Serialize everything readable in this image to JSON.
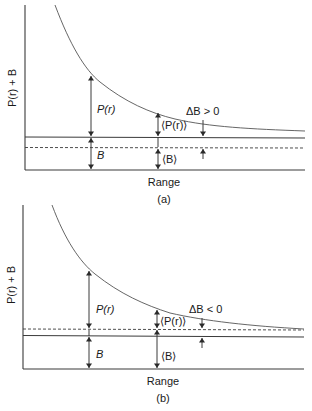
{
  "panels": [
    {
      "id": "a",
      "caption": "(a)",
      "y_axis_label": "P(r) + B",
      "x_axis_label": "Range",
      "label_pr": "P(r)",
      "label_b": "B",
      "label_mean_pr": "⟨P(r)⟩",
      "label_mean_b": "⟨B⟩",
      "label_delta_b": "ΔB > 0",
      "description": "True background B (solid line) above estimated mean background ⟨B⟩ (dashed line)"
    },
    {
      "id": "b",
      "caption": "(b)",
      "y_axis_label": "P(r) + B",
      "x_axis_label": "Range",
      "label_pr": "P(r)",
      "label_b": "B",
      "label_mean_pr": "⟨P(r)⟩",
      "label_mean_b": "⟨B⟩",
      "label_delta_b": "ΔB < 0",
      "description": "Estimated mean background ⟨B⟩ (dashed line) above true background B (solid line)"
    }
  ],
  "colors": {
    "line": "#3a3a3a",
    "curve": "#555555",
    "text": "#1a1a1a",
    "background": "#ffffff"
  }
}
